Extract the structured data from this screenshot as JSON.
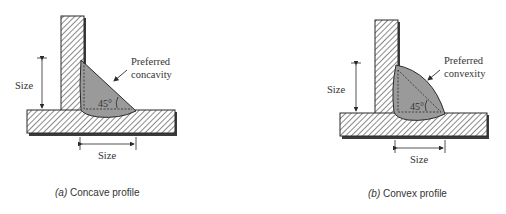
{
  "figures": [
    {
      "id": "a",
      "caption_letter": "(a)",
      "caption_text": " Concave profile",
      "vertical_size_label": "Size",
      "horizontal_size_label": "Size",
      "callout_line1": "Preferred",
      "callout_line2": "concavity",
      "angle_label": "45°",
      "profile": "concave"
    },
    {
      "id": "b",
      "caption_letter": "(b)",
      "caption_text": " Convex profile",
      "vertical_size_label": "Size",
      "horizontal_size_label": "Size",
      "callout_line1": "Preferred",
      "callout_line2": "convexity",
      "angle_label": "45°",
      "profile": "convex"
    }
  ],
  "colors": {
    "weld_fill": "#9a9a9a",
    "line": "#2a2a2a",
    "shadow": "#3a3a3a",
    "hatch": "#4a4a4a"
  }
}
